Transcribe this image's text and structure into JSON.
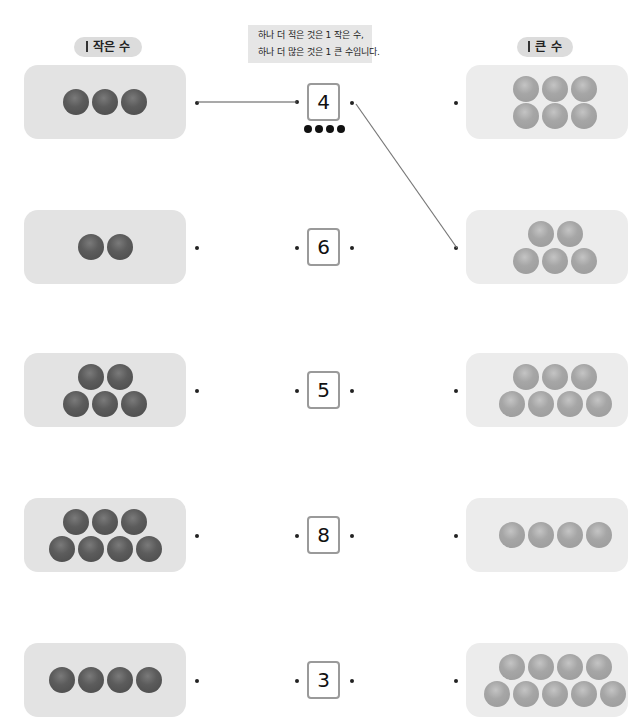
{
  "labels": {
    "smaller": "작은 수",
    "bigger": "큰 수"
  },
  "hint": {
    "line1": "하나 더 적은 것은 1 작은 수,",
    "line2": "하나 더 많은 것은 1 큰 수입니다."
  },
  "rows": [
    {
      "number": "4",
      "left_count": 3,
      "right_count": 6
    },
    {
      "number": "6",
      "left_count": 2,
      "right_count": 5
    },
    {
      "number": "5",
      "left_count": 5,
      "right_count": 7
    },
    {
      "number": "8",
      "left_count": 7,
      "right_count": 4
    },
    {
      "number": "3",
      "left_count": 4,
      "right_count": 9
    }
  ],
  "example_counters": 4,
  "connections": [
    {
      "from": "left-row-1",
      "to": "number-row-1"
    },
    {
      "from": "number-row-1",
      "to": "right-row-2"
    }
  ],
  "colors": {
    "card_left": "#e3e3e3",
    "card_right": "#ececec",
    "ball_dark": "#555555",
    "ball_light": "#a6a6a6",
    "line": "#555555"
  }
}
